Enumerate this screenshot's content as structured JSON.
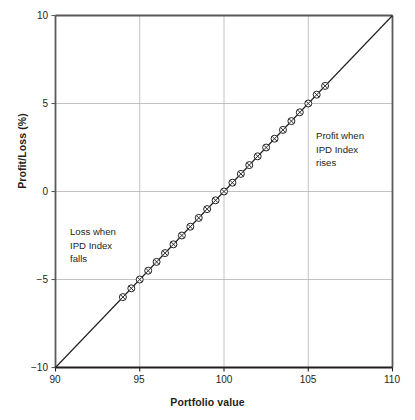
{
  "chart_data": {
    "type": "line",
    "title": "",
    "subtitle": "",
    "xlabel": "Portfolio value",
    "ylabel": "Profit/Loss (%)",
    "xlim": [
      90,
      110
    ],
    "ylim": [
      -10,
      10
    ],
    "xticks": [
      "90",
      "95",
      "100",
      "105",
      "110"
    ],
    "xtick_values": [
      90,
      95,
      100,
      105,
      110
    ],
    "yticks": [
      "10",
      "5",
      "0",
      "−5",
      "−10"
    ],
    "ytick_values": [
      10,
      5,
      0,
      -5,
      -10
    ],
    "grid": true,
    "grid_color": "#b3b3b3",
    "legend": "none",
    "line_color": "#231f20",
    "marker": "circle-x",
    "series": [
      {
        "name": "Profit/Loss vs Portfolio value",
        "line_x": [
          90,
          110
        ],
        "line_y": [
          -10,
          10
        ],
        "x": [
          94,
          94.5,
          95,
          95.5,
          96,
          96.5,
          97,
          97.5,
          98,
          98.5,
          99,
          99.5,
          100,
          100.5,
          101,
          101.5,
          102,
          102.5,
          103,
          103.5,
          104,
          104.5,
          105,
          105.5,
          106
        ],
        "values": [
          -6,
          -5.5,
          -5,
          -4.5,
          -4,
          -3.5,
          -3,
          -2.5,
          -2,
          -1.5,
          -1,
          -0.5,
          0,
          0.5,
          1,
          1.5,
          2,
          2.5,
          3,
          3.5,
          4,
          4.5,
          5,
          5.5,
          6
        ]
      }
    ],
    "annotations": [
      {
        "id": "loss-annotation",
        "text": "Loss when\nIPD Index\nfalls",
        "x": 92.2,
        "y": -2.8
      },
      {
        "id": "profit-annotation",
        "text": "Profit when\nIPD Index\nrises",
        "x": 105.2,
        "y": 3.2
      }
    ]
  }
}
